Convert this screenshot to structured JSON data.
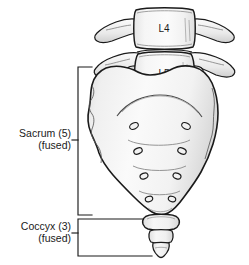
{
  "figure": {
    "background_color": "#ffffff",
    "line_color": "#1a1a1a",
    "bone_fill": "#f7f7f7",
    "bone_shade": "#e4e4e4",
    "text_color": "#1a1a1a"
  },
  "vertebrae": [
    {
      "id": "l4",
      "label": "L4",
      "name": "lumbar-vertebra-l4"
    },
    {
      "id": "l5",
      "label": "L5",
      "name": "lumbar-vertebra-l5"
    }
  ],
  "annotations": [
    {
      "id": "sacrum",
      "line1": "Sacrum (5)",
      "line2": "(fused)",
      "bracket": "left-bracket",
      "segment_count": 5,
      "state": "fused"
    },
    {
      "id": "coccyx",
      "line1": "Coccyx (3)",
      "line2": "(fused)",
      "bracket": "left-bracket",
      "segment_count": 3,
      "state": "fused"
    }
  ],
  "structures": {
    "sacral_foramina_pairs": 4,
    "coccyx_segments": 3,
    "transverse_processes": 4
  }
}
